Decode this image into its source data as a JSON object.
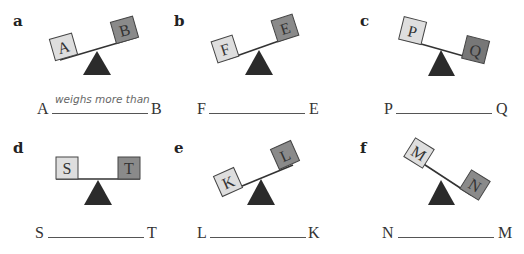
{
  "colors": {
    "light_box": "#dedede",
    "dark_box": "#8a8a8a",
    "fulcrum": "#2b2b2b",
    "beam": "#333333"
  },
  "panels": [
    {
      "label": "a",
      "left_box": "A",
      "right_box": "B",
      "tilt": "right-up",
      "answer_left": "A",
      "answer_right": "B",
      "answer_text": "weighs more than"
    },
    {
      "label": "b",
      "left_box": "F",
      "right_box": "E",
      "tilt": "right-up",
      "answer_left": "F",
      "answer_right": "E",
      "answer_text": ""
    },
    {
      "label": "c",
      "left_box": "P",
      "right_box": "Q",
      "tilt": "left-up",
      "answer_left": "P",
      "answer_right": "Q",
      "answer_text": ""
    },
    {
      "label": "d",
      "left_box": "S",
      "right_box": "T",
      "tilt": "level",
      "answer_left": "S",
      "answer_right": "T",
      "answer_text": ""
    },
    {
      "label": "e",
      "left_box": "K",
      "right_box": "L",
      "tilt": "right-up",
      "answer_left": "L",
      "answer_right": "K",
      "answer_text": ""
    },
    {
      "label": "f",
      "left_box": "M",
      "right_box": "N",
      "tilt": "left-up",
      "answer_left": "N",
      "answer_right": "M",
      "answer_text": ""
    }
  ]
}
